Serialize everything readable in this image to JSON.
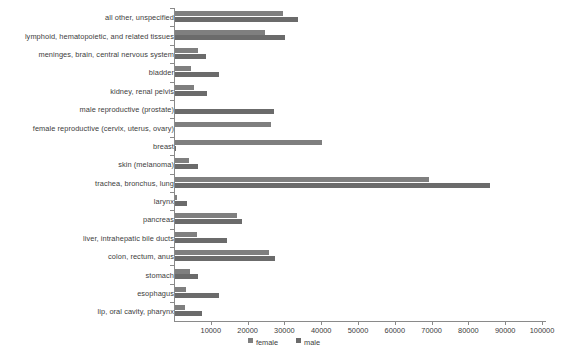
{
  "chart_data": {
    "type": "bar",
    "orientation": "horizontal",
    "title": "",
    "subtitle": "",
    "xlabel": "",
    "ylabel": "",
    "xlim": [
      0,
      100000
    ],
    "ylim": null,
    "grid": false,
    "legend_position": "bottom-center",
    "categories": [
      "all other, unspecified",
      "lymphoid, hematopoietic, and related tissues",
      "meninges, brain, central nervous system",
      "bladder",
      "kidney, renal pelvis",
      "male reproductive (prostate)",
      "female reproductive (cervix, uterus, ovary)",
      "breast",
      "skin (melanoma)",
      "trachea, bronchus, lung",
      "larynx",
      "pancreas",
      "liver, intrahepatic bile ducts",
      "colon, rectum, anus",
      "stomach",
      "esophagus",
      "lip, oral cavity, pharynx"
    ],
    "series": [
      {
        "name": "female",
        "color": "#7f7f7f",
        "values": [
          29500,
          24700,
          6500,
          4700,
          5400,
          0,
          26300,
          40300,
          4000,
          69400,
          800,
          17100,
          6300,
          25800,
          4300,
          3200,
          2900
        ]
      },
      {
        "name": "male",
        "color": "#6b6b6b",
        "values": [
          33600,
          30100,
          8600,
          12200,
          9100,
          27100,
          0,
          450,
          6600,
          85800,
          3400,
          18500,
          14400,
          27400,
          6400,
          12100,
          7600
        ]
      }
    ],
    "xticks": [
      10000,
      20000,
      30000,
      40000,
      50000,
      60000,
      70000,
      80000,
      90000,
      100000
    ],
    "xtick_labels": [
      "10000",
      "20000",
      "30000",
      "40000",
      "50000",
      "60000",
      "70000",
      "80000",
      "90000",
      "100000"
    ],
    "legend": [
      {
        "label": "female",
        "color": "#7f7f7f"
      },
      {
        "label": "male",
        "color": "#6b6b6b"
      }
    ]
  },
  "axis": {
    "line_color": "#8a8a8a"
  }
}
